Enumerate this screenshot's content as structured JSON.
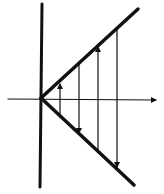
{
  "diagram": {
    "type": "cobweb-oscillation",
    "background": "#ffffff",
    "ink": "#111111",
    "origin": [
      41,
      98
    ],
    "axes": {
      "vertical": {
        "x1": 42,
        "y1": 4,
        "x2": 40,
        "y2": 187
      },
      "horizontal": {
        "x1": 8,
        "y1": 99,
        "x2": 156,
        "y2": 100
      }
    },
    "lines": {
      "upper": {
        "x1": 41,
        "y1": 98,
        "x2": 138,
        "y2": 9
      },
      "lower": {
        "x1": 41,
        "y1": 98,
        "x2": 134,
        "y2": 185
      }
    },
    "arrows": [
      {
        "x": 60,
        "from": 115,
        "to": 84,
        "direction": "up"
      },
      {
        "x": 79,
        "from": 64,
        "to": 133,
        "direction": "down"
      },
      {
        "x": 98,
        "from": 150,
        "to": 47,
        "direction": "up"
      },
      {
        "x": 117,
        "from": 28,
        "to": 167,
        "direction": "down"
      }
    ]
  }
}
